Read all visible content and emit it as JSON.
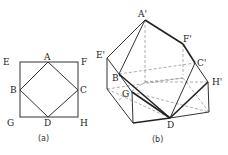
{
  "figure_a": {
    "caption": "(a)",
    "labels": {
      "A": "A",
      "B": "B",
      "C": "C",
      "D": "D",
      "E": "E",
      "F": "F",
      "G": "G",
      "H": "H"
    }
  },
  "figure_b": {
    "caption": "(b)",
    "labels": {
      "A": "A'",
      "B": "B'",
      "C": "C'",
      "D": "D",
      "E": "E'",
      "F": "F'",
      "G": "G",
      "H": "H'"
    }
  }
}
